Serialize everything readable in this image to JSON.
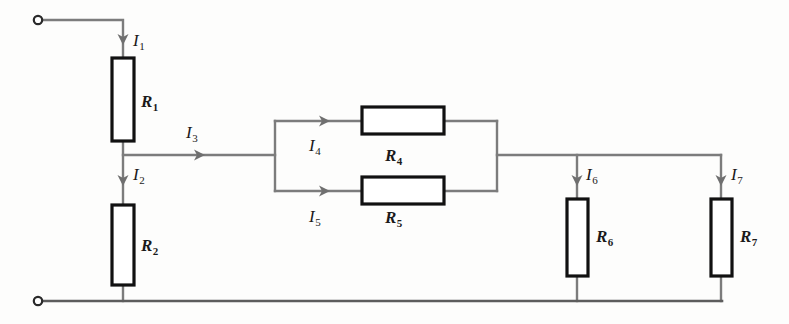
{
  "figure": {
    "name": "resistor-network-circuit-diagram",
    "background_color": "#fdfdfc",
    "wire_color": "#7c7c7c",
    "resistor_outline_color": "#111111",
    "label_color": "#1a1a1a"
  },
  "terminals": [
    {
      "id": "terminal-top-left",
      "symbol": "o",
      "x": 38,
      "y": 20
    },
    {
      "id": "terminal-bottom-left",
      "symbol": "o",
      "x": 38,
      "y": 301
    }
  ],
  "resistors": [
    {
      "id": "R1",
      "letter": "R",
      "subscript": "1",
      "label": "R1",
      "orientation": "vertical",
      "x": 112,
      "y": 58,
      "w": 22,
      "h": 83,
      "label_x": 141,
      "label_y": 93
    },
    {
      "id": "R2",
      "letter": "R",
      "subscript": "2",
      "label": "R2",
      "orientation": "vertical",
      "x": 112,
      "y": 205,
      "w": 22,
      "h": 80,
      "label_x": 141,
      "label_y": 237
    },
    {
      "id": "R4",
      "letter": "R",
      "subscript": "4",
      "label": "R4",
      "orientation": "horizontal",
      "x": 362,
      "y": 107,
      "w": 82,
      "h": 27,
      "label_x": 385,
      "label_y": 147
    },
    {
      "id": "R5",
      "letter": "R",
      "subscript": "5",
      "label": "R5",
      "orientation": "horizontal",
      "x": 362,
      "y": 177,
      "w": 82,
      "h": 27,
      "label_x": 385,
      "label_y": 209
    },
    {
      "id": "R6",
      "letter": "R",
      "subscript": "6",
      "label": "R6",
      "orientation": "vertical",
      "x": 567,
      "y": 199,
      "w": 21,
      "h": 77,
      "label_x": 596,
      "label_y": 228
    },
    {
      "id": "R7",
      "letter": "R",
      "subscript": "7",
      "label": "R7",
      "orientation": "vertical",
      "x": 711,
      "y": 199,
      "w": 21,
      "h": 77,
      "label_x": 740,
      "label_y": 228
    }
  ],
  "currents": [
    {
      "id": "I1",
      "letter": "I",
      "subscript": "1",
      "label": "I1",
      "direction": "down",
      "arrow_x": 123,
      "arrow_y": 45,
      "label_x": 133,
      "label_y": 32
    },
    {
      "id": "I2",
      "letter": "I",
      "subscript": "2",
      "label": "I2",
      "direction": "down",
      "arrow_x": 123,
      "arrow_y": 186,
      "label_x": 133,
      "label_y": 166
    },
    {
      "id": "I3",
      "letter": "I",
      "subscript": "3",
      "label": "I3",
      "direction": "right",
      "arrow_x": 205,
      "arrow_y": 155,
      "label_x": 186,
      "label_y": 124
    },
    {
      "id": "I4",
      "letter": "I",
      "subscript": "4",
      "label": "I4",
      "direction": "right",
      "arrow_x": 330,
      "arrow_y": 121,
      "label_x": 309,
      "label_y": 137
    },
    {
      "id": "I5",
      "letter": "I",
      "subscript": "5",
      "label": "I5",
      "direction": "right",
      "arrow_x": 330,
      "arrow_y": 191,
      "label_x": 309,
      "label_y": 208
    },
    {
      "id": "I6",
      "letter": "I",
      "subscript": "6",
      "label": "I6",
      "direction": "down",
      "arrow_x": 577,
      "arrow_y": 186,
      "label_x": 586,
      "label_y": 166
    },
    {
      "id": "I7",
      "letter": "I",
      "subscript": "7",
      "label": "I7",
      "direction": "down",
      "arrow_x": 721,
      "arrow_y": 186,
      "label_x": 731,
      "label_y": 166
    }
  ],
  "wires": {
    "top_lead": "M 44 20 L 123 20 L 123 58",
    "r1_to_node": "M 123 141 L 123 205",
    "branch_i3": "M 123 155 L 275 155",
    "r2_to_bottom": "M 123 285 L 123 301",
    "parallel_left_node": "M 275 121 L 275 191",
    "branch4_left": "M 275 121 L 362 121",
    "branch4_right": "M 444 121 L 497 121",
    "branch5_left": "M 275 191 L 362 191",
    "branch5_right": "M 444 191 L 497 191",
    "parallel_right_node": "M 497 121 L 497 191",
    "right_bus": "M 497 155 L 721 155",
    "r6_top_stub": "M 577 155 L 577 199",
    "r6_bottom_stub": "M 577 276 L 577 301",
    "r7_top_stub": "M 721 155 L 721 199",
    "r7_bottom_stub": "M 721 276 L 721 301",
    "bottom_rail": "M 44 301 L 722 301"
  }
}
